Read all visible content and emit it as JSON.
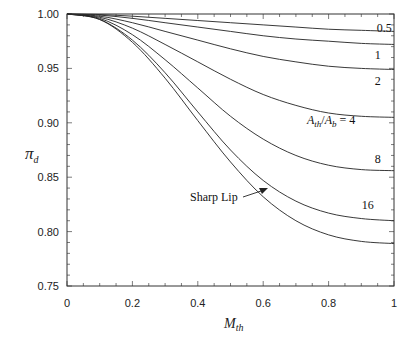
{
  "chart_data": {
    "type": "line",
    "title": "",
    "xlabel": "M_th",
    "ylabel": "π_d",
    "xlim": [
      0,
      1
    ],
    "ylim": [
      0.75,
      1.0
    ],
    "x_ticks": [
      "0",
      "0.2",
      "0.4",
      "0.6",
      "0.8",
      "1"
    ],
    "y_ticks": [
      "0.75",
      "0.80",
      "0.85",
      "0.90",
      "0.95",
      "1.00"
    ],
    "grid": false,
    "x": [
      0,
      0.1,
      0.2,
      0.3,
      0.4,
      0.5,
      0.6,
      0.7,
      0.8,
      0.9,
      1.0
    ],
    "series": [
      {
        "name": "0.5",
        "values": [
          1.0,
          0.9995,
          0.998,
          0.996,
          0.994,
          0.992,
          0.99,
          0.988,
          0.986,
          0.985,
          0.984
        ]
      },
      {
        "name": "1",
        "values": [
          1.0,
          0.999,
          0.996,
          0.992,
          0.988,
          0.984,
          0.98,
          0.977,
          0.975,
          0.973,
          0.972
        ]
      },
      {
        "name": "2",
        "values": [
          1.0,
          0.998,
          0.992,
          0.984,
          0.976,
          0.968,
          0.961,
          0.956,
          0.952,
          0.95,
          0.949
        ]
      },
      {
        "name": "A_th/A_b = 4",
        "values": [
          1.0,
          0.997,
          0.987,
          0.972,
          0.956,
          0.94,
          0.926,
          0.916,
          0.909,
          0.906,
          0.905
        ]
      },
      {
        "name": "8",
        "values": [
          1.0,
          0.996,
          0.981,
          0.958,
          0.932,
          0.906,
          0.885,
          0.87,
          0.861,
          0.857,
          0.856
        ]
      },
      {
        "name": "16",
        "values": [
          1.0,
          0.995,
          0.976,
          0.946,
          0.91,
          0.875,
          0.847,
          0.828,
          0.817,
          0.812,
          0.81
        ]
      },
      {
        "name": "Sharp Lip",
        "values": [
          1.0,
          0.995,
          0.974,
          0.941,
          0.902,
          0.864,
          0.832,
          0.81,
          0.797,
          0.791,
          0.789
        ]
      }
    ],
    "annotations": [
      {
        "text": "0.5",
        "x": 0.97,
        "y": 0.987
      },
      {
        "text": "1",
        "x": 0.95,
        "y": 0.962
      },
      {
        "text": "2",
        "x": 0.95,
        "y": 0.938
      },
      {
        "text": "A_th/A_b = 4",
        "x": 0.85,
        "y": 0.894
      },
      {
        "text": "8",
        "x": 0.95,
        "y": 0.867
      },
      {
        "text": "16",
        "x": 0.92,
        "y": 0.824
      },
      {
        "text": "Sharp Lip",
        "x": 0.28,
        "y": 0.84,
        "arrow_to": {
          "x": 0.42,
          "y": 0.862
        }
      }
    ]
  },
  "labels": {
    "y_axis": "π",
    "y_axis_sub": "d",
    "x_axis": "M",
    "x_axis_sub": "th",
    "area_ratio_a": "A",
    "area_ratio_a_sub": "th",
    "area_ratio_sep": "/",
    "area_ratio_b": "A",
    "area_ratio_b_sub": "b",
    "area_ratio_eq": " = 4",
    "sharp_lip": "Sharp Lip"
  }
}
